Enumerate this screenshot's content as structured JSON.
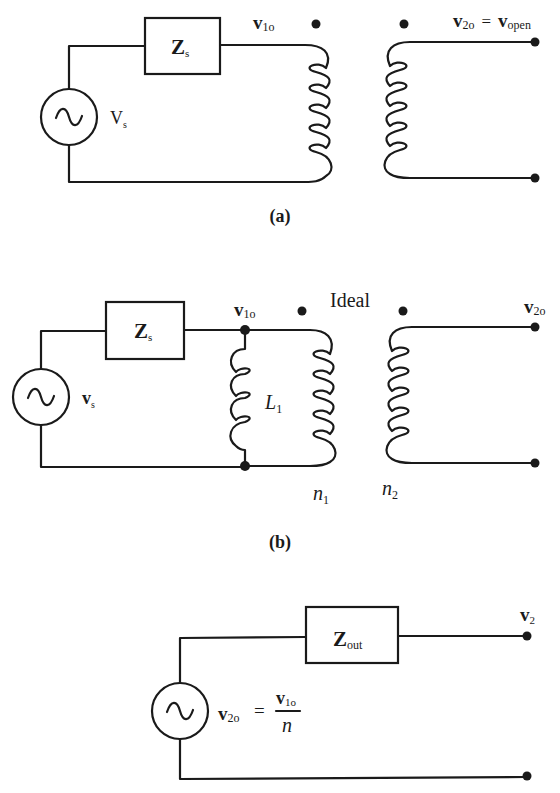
{
  "figure": {
    "panel_a": {
      "caption": "(a)",
      "impedance_label": {
        "main": "Z",
        "sub": "s"
      },
      "source_label": {
        "main": "V",
        "sub": "s"
      },
      "primary_voltage_label": {
        "main": "v",
        "sub": "1o"
      },
      "output_label": {
        "main": "v",
        "sub": "2o",
        "equals": "=",
        "rhs_main": "v",
        "rhs_sub": "open"
      }
    },
    "panel_b": {
      "caption": "(b)",
      "impedance_label": {
        "main": "Z",
        "sub": "s"
      },
      "source_label": {
        "main": "v",
        "sub": "s"
      },
      "primary_voltage_label": {
        "main": "v",
        "sub": "1o"
      },
      "magnetizing_inductance_label": {
        "main": "L",
        "sub": "1"
      },
      "transformer_label": "Ideal",
      "primary_turns_label": {
        "main": "n",
        "sub": "1"
      },
      "secondary_turns_label": {
        "main": "n",
        "sub": "2"
      },
      "output_label": {
        "main": "v",
        "sub": "2o"
      }
    },
    "panel_c": {
      "impedance_label": {
        "main": "Z",
        "sub": "out"
      },
      "output_label": {
        "main": "v",
        "sub": "2"
      },
      "source_equation": {
        "lhs_main": "v",
        "lhs_sub": "2o",
        "equals": "=",
        "num_main": "v",
        "num_sub": "1o",
        "den": "n"
      }
    },
    "source_symbol": "~"
  }
}
